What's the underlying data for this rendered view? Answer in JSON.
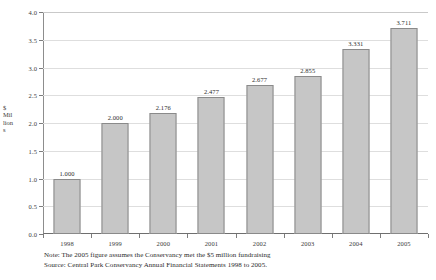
{
  "chart_data": {
    "type": "bar",
    "title": "",
    "subtitle": "",
    "xlabel": "",
    "ylabel": "$ Millions",
    "ylabel_lines": [
      "$",
      "Mil",
      "lion",
      "s"
    ],
    "categories": [
      "1998",
      "1999",
      "2000",
      "2001",
      "2002",
      "2003",
      "2004",
      "2005"
    ],
    "values": [
      1.0,
      2.0,
      2.176,
      2.477,
      2.677,
      2.855,
      3.331,
      3.711
    ],
    "value_labels": [
      "1.000",
      "2.000",
      "2.176",
      "2.477",
      "2.677",
      "2.855",
      "3.331",
      "3.711"
    ],
    "ylim": [
      0.0,
      4.0
    ],
    "ytick_values": [
      0.0,
      0.5,
      1.0,
      1.5,
      2.0,
      2.5,
      3.0,
      3.5,
      4.0
    ],
    "ytick_labels": [
      "0.0",
      "0.5",
      "1.0",
      "1.5",
      "2.0",
      "2.5",
      "3.0",
      "3.5",
      "4.0"
    ],
    "grid": true,
    "legend": null,
    "bar_color": "#c6c6c6",
    "bar_border_color": "#8a8a8a",
    "grid_color": "#dedede",
    "axis_color": "#7d7d7d"
  },
  "notes": {
    "note_line": "Note:  The 2005 figure assumes the Conservancy met the $5 million fundraising",
    "source_line": "Source:  Central Park Conservancy Annual Financial Statements 1998 to 2005."
  }
}
